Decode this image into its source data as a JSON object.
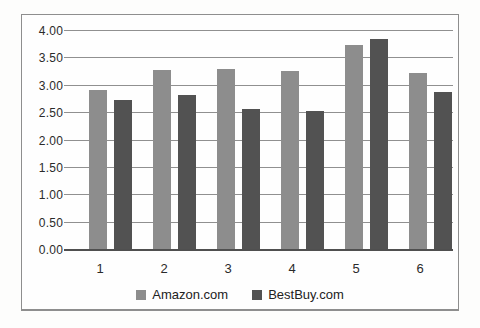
{
  "chart_data": {
    "type": "bar",
    "title": "",
    "xlabel": "",
    "ylabel": "",
    "categories": [
      "1",
      "2",
      "3",
      "4",
      "5",
      "6"
    ],
    "series": [
      {
        "name": "Amazon.com",
        "color": "#8d8d8d",
        "values": [
          2.92,
          3.28,
          3.31,
          3.27,
          3.74,
          3.24
        ]
      },
      {
        "name": "BestBuy.com",
        "color": "#525252",
        "values": [
          2.74,
          2.84,
          2.57,
          2.53,
          3.85,
          2.89
        ]
      }
    ],
    "ylim": [
      0,
      4
    ],
    "ytick_step": 0.5,
    "ytick_labels": [
      "0.00",
      "0.50",
      "1.00",
      "1.50",
      "2.00",
      "2.50",
      "3.00",
      "3.50",
      "4.00"
    ],
    "grid": true,
    "legend_position": "bottom"
  }
}
